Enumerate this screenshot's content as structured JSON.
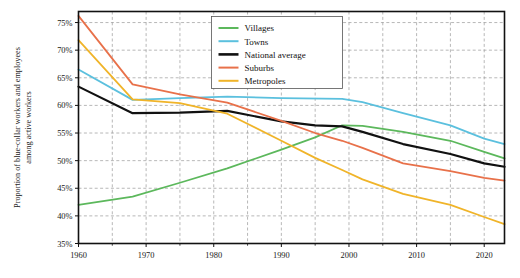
{
  "chart_data": {
    "type": "line",
    "title": "",
    "xlabel": "",
    "ylabel": "Proportion of blue-collar workers and employees among active workers",
    "xlim": [
      1960,
      2023
    ],
    "ylim": [
      35,
      77
    ],
    "xticks": [
      1960,
      1970,
      1980,
      1990,
      2000,
      2010,
      2020
    ],
    "xtick_labels": [
      "1960",
      "1970",
      "1980",
      "1990",
      "2000",
      "2010",
      "2020"
    ],
    "xminor_ticks": [
      1965,
      1975,
      1985,
      1995,
      2005,
      2015
    ],
    "yticks": [
      35,
      40,
      45,
      50,
      55,
      60,
      65,
      70,
      75
    ],
    "ytick_labels": [
      "35%",
      "40%",
      "45%",
      "50%",
      "55%",
      "60%",
      "65%",
      "70%",
      "75%"
    ],
    "grid": true,
    "grid_style": "dashed",
    "legend_position": "top-right",
    "series": [
      {
        "name": "Villages",
        "color": "#5cb85c",
        "x": [
          1960,
          1968,
          1975,
          1982,
          1990,
          1995,
          1999,
          2002,
          2008,
          2015,
          2020,
          2023
        ],
        "values": [
          42.0,
          43.5,
          46.0,
          48.6,
          52.0,
          54.2,
          56.4,
          56.3,
          55.2,
          53.6,
          51.6,
          50.4
        ]
      },
      {
        "name": "Towns",
        "color": "#5bc0de",
        "x": [
          1960,
          1968,
          1975,
          1982,
          1990,
          1999,
          2002,
          2008,
          2015,
          2020,
          2023
        ],
        "values": [
          66.5,
          61.0,
          61.3,
          61.6,
          61.3,
          61.2,
          60.6,
          58.6,
          56.4,
          54.0,
          53.0
        ]
      },
      {
        "name": "National average",
        "color": "#111111",
        "x": [
          1960,
          1968,
          1975,
          1982,
          1990,
          1995,
          1999,
          2002,
          2008,
          2015,
          2020,
          2023
        ],
        "values": [
          63.4,
          58.6,
          58.7,
          59.0,
          57.1,
          56.4,
          56.2,
          55.2,
          53.0,
          51.2,
          49.5,
          48.9
        ]
      },
      {
        "name": "Suburbs",
        "color": "#e8714a",
        "x": [
          1960,
          1968,
          1975,
          1982,
          1990,
          1995,
          1999,
          2002,
          2008,
          2015,
          2020,
          2023
        ],
        "values": [
          76.2,
          63.8,
          62.0,
          60.5,
          57.2,
          55.0,
          53.6,
          52.3,
          49.5,
          48.1,
          46.9,
          46.4
        ]
      },
      {
        "name": "Metropoles",
        "color": "#f0b429",
        "x": [
          1960,
          1968,
          1975,
          1982,
          1990,
          1995,
          1999,
          2002,
          2008,
          2015,
          2020,
          2023
        ],
        "values": [
          71.8,
          61.1,
          60.4,
          58.5,
          53.6,
          50.5,
          48.3,
          46.6,
          44.0,
          42.0,
          39.8,
          38.5
        ]
      }
    ]
  },
  "legend": {
    "items": [
      {
        "label": "Villages"
      },
      {
        "label": "Towns"
      },
      {
        "label": "National average"
      },
      {
        "label": "Suburbs"
      },
      {
        "label": "Metropoles"
      }
    ]
  },
  "axes": {
    "y_axis_title": "Proportion of blue-collar workers and employees among active workers"
  }
}
